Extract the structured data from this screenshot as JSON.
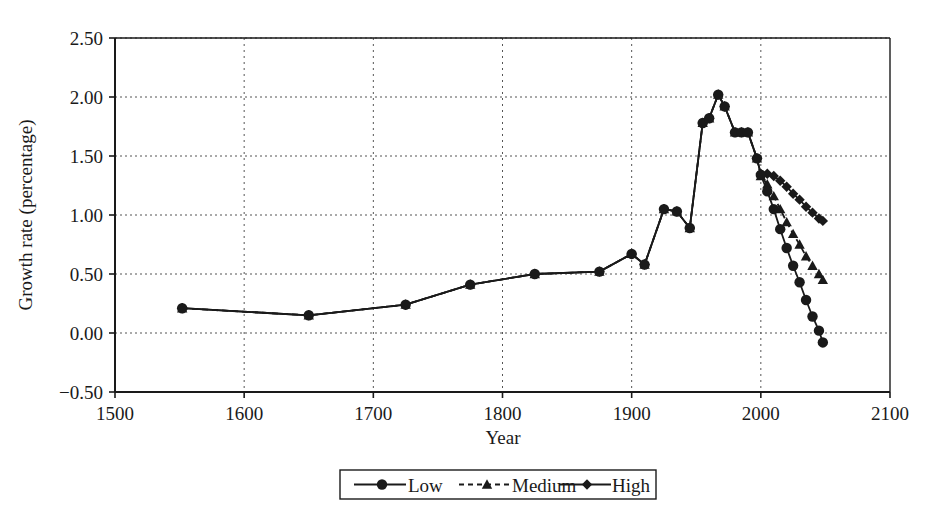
{
  "chart_data": {
    "type": "line",
    "title": "",
    "xlabel": "Year",
    "ylabel": "Growth rate (percentage)",
    "xlim": [
      1500,
      2100
    ],
    "ylim": [
      -0.5,
      2.5
    ],
    "x_ticks": [
      1500,
      1600,
      1700,
      1800,
      1900,
      2000,
      2100
    ],
    "x_tick_labels": [
      "1500",
      "1600",
      "1700",
      "1800",
      "1900",
      "2000",
      "2100"
    ],
    "y_ticks": [
      -0.5,
      0.0,
      0.5,
      1.0,
      1.5,
      2.0,
      2.5
    ],
    "y_tick_labels": [
      "-0.50",
      "0.00",
      "0.50",
      "1.00",
      "1.50",
      "2.00",
      "2.50"
    ],
    "grid": true,
    "grid_style": "dotted",
    "legend_position": "bottom-center",
    "legend_entries": [
      "Low",
      "Medium",
      "High"
    ],
    "series": [
      {
        "name": "Low",
        "marker": "circle",
        "line": "solid",
        "color": "#1a1a1a",
        "points": [
          [
            1552,
            0.21
          ],
          [
            1650,
            0.15
          ],
          [
            1725,
            0.24
          ],
          [
            1775,
            0.41
          ],
          [
            1825,
            0.5
          ],
          [
            1875,
            0.52
          ],
          [
            1900,
            0.67
          ],
          [
            1910,
            0.58
          ],
          [
            1925,
            1.05
          ],
          [
            1935,
            1.03
          ],
          [
            1945,
            0.89
          ],
          [
            1955,
            1.78
          ],
          [
            1960,
            1.82
          ],
          [
            1967,
            2.02
          ],
          [
            1972,
            1.92
          ],
          [
            1980,
            1.7
          ],
          [
            1985,
            1.7
          ],
          [
            1990,
            1.7
          ],
          [
            1997,
            1.48
          ],
          [
            2000,
            1.34
          ],
          [
            2005,
            1.2
          ],
          [
            2010,
            1.05
          ],
          [
            2015,
            0.88
          ],
          [
            2020,
            0.72
          ],
          [
            2025,
            0.57
          ],
          [
            2030,
            0.43
          ],
          [
            2035,
            0.28
          ],
          [
            2040,
            0.14
          ],
          [
            2045,
            0.02
          ],
          [
            2048,
            -0.08
          ]
        ]
      },
      {
        "name": "Medium",
        "marker": "triangle",
        "line": "dashed",
        "color": "#1a1a1a",
        "points": [
          [
            1552,
            0.21
          ],
          [
            1650,
            0.15
          ],
          [
            1725,
            0.24
          ],
          [
            1775,
            0.41
          ],
          [
            1825,
            0.5
          ],
          [
            1875,
            0.52
          ],
          [
            1900,
            0.67
          ],
          [
            1910,
            0.58
          ],
          [
            1925,
            1.05
          ],
          [
            1935,
            1.03
          ],
          [
            1945,
            0.89
          ],
          [
            1955,
            1.78
          ],
          [
            1960,
            1.82
          ],
          [
            1967,
            2.02
          ],
          [
            1972,
            1.92
          ],
          [
            1980,
            1.7
          ],
          [
            1985,
            1.7
          ],
          [
            1990,
            1.7
          ],
          [
            1997,
            1.48
          ],
          [
            2000,
            1.33
          ],
          [
            2005,
            1.26
          ],
          [
            2010,
            1.16
          ],
          [
            2015,
            1.05
          ],
          [
            2020,
            0.94
          ],
          [
            2025,
            0.84
          ],
          [
            2030,
            0.75
          ],
          [
            2035,
            0.65
          ],
          [
            2040,
            0.57
          ],
          [
            2045,
            0.5
          ],
          [
            2048,
            0.45
          ]
        ]
      },
      {
        "name": "High",
        "marker": "diamond",
        "line": "solid",
        "color": "#1a1a1a",
        "points": [
          [
            1552,
            0.21
          ],
          [
            1650,
            0.15
          ],
          [
            1725,
            0.24
          ],
          [
            1775,
            0.41
          ],
          [
            1825,
            0.5
          ],
          [
            1875,
            0.52
          ],
          [
            1900,
            0.67
          ],
          [
            1910,
            0.58
          ],
          [
            1925,
            1.05
          ],
          [
            1935,
            1.03
          ],
          [
            1945,
            0.89
          ],
          [
            1955,
            1.78
          ],
          [
            1960,
            1.82
          ],
          [
            1967,
            2.02
          ],
          [
            1972,
            1.92
          ],
          [
            1980,
            1.7
          ],
          [
            1985,
            1.7
          ],
          [
            1990,
            1.7
          ],
          [
            1997,
            1.48
          ],
          [
            2000,
            1.35
          ],
          [
            2005,
            1.35
          ],
          [
            2010,
            1.33
          ],
          [
            2015,
            1.29
          ],
          [
            2020,
            1.24
          ],
          [
            2025,
            1.18
          ],
          [
            2030,
            1.13
          ],
          [
            2035,
            1.07
          ],
          [
            2040,
            1.02
          ],
          [
            2045,
            0.97
          ],
          [
            2048,
            0.95
          ]
        ]
      }
    ]
  },
  "legend": {
    "items": [
      {
        "label": "Low",
        "marker": "circle",
        "line": "solid"
      },
      {
        "label": "Medium",
        "marker": "triangle",
        "line": "dashed"
      },
      {
        "label": "High",
        "marker": "diamond",
        "line": "solid"
      }
    ]
  },
  "axes": {
    "x_title": "Year",
    "y_title": "Growth rate (percentage)"
  },
  "colors": {
    "ink": "#1a1a1a",
    "grid": "#555555",
    "background": "#ffffff"
  }
}
